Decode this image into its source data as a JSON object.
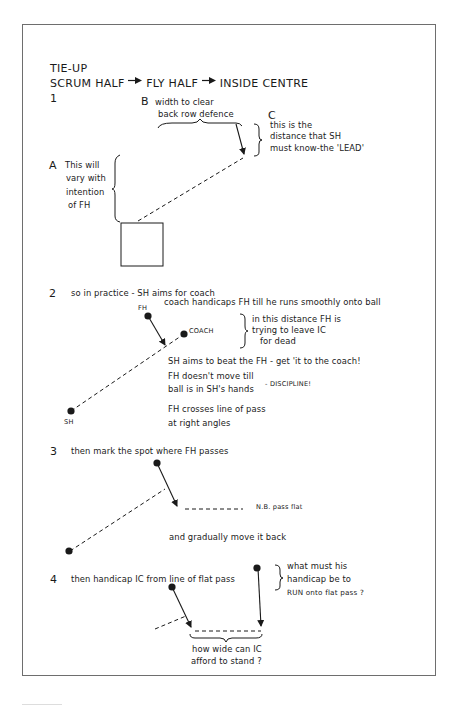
{
  "title": "TIE-UP",
  "subtitle": {
    "scrum_half": "SCRUM HALF",
    "fly_half": "FLY HALF",
    "inside_centre": "INSIDE CENTRE"
  },
  "section1": {
    "number": "1",
    "label_b": "B",
    "b_lines": [
      "width to clear",
      "back row defence"
    ],
    "label_c": "C",
    "c_lines": [
      "this is the",
      "distance that SH",
      "must know-the 'LEAD'"
    ],
    "label_a": "A",
    "a_lines": [
      "This will",
      "vary with",
      "intention",
      "of FH"
    ]
  },
  "section2": {
    "number": "2",
    "intro": "so in practice - SH aims for coach",
    "coach_note": "coach handicaps FH till he runs smoothly onto ball",
    "fh_label": "FH",
    "coach_label": "COACH",
    "sh_label": "SH",
    "distance_lines": [
      "in this distance FH is",
      "trying to leave IC",
      "for dead"
    ],
    "beat_note": "SH aims to beat the FH - get 'it to the coach!",
    "move_lines": [
      "FH doesn't move till",
      "ball is in SH's hands"
    ],
    "discipline": "- DISCIPLINE!",
    "cross_lines": [
      "FH crosses line of pass",
      "at right angles"
    ]
  },
  "section3": {
    "number": "3",
    "intro": "then mark the spot where FH passes",
    "nb": "N.B. pass flat",
    "move_back": "and gradually move it back"
  },
  "section4": {
    "number": "4",
    "intro": "then handicap IC from line of flat pass",
    "question_lines": [
      "what must his",
      "handicap be to",
      "RUN onto flat pass ?"
    ],
    "width_lines": [
      "how wide can IC",
      "afford to stand ?"
    ]
  },
  "colors": {
    "ink": "#1a1a1a",
    "frame": "#6e6e6e",
    "paper": "#ffffff"
  }
}
